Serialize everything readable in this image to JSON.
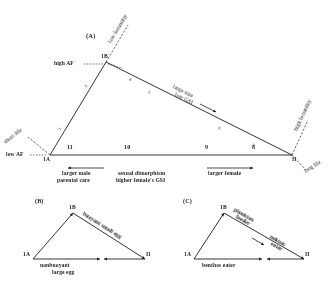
{
  "figure": {
    "caption_none": "",
    "panels": [
      {
        "id": "panel-a",
        "label": "(A)",
        "vertices": {
          "left": "1A",
          "top": "1B",
          "right": "II"
        },
        "axis_numbers_bottom": [
          "11",
          "10",
          "9",
          "8"
        ],
        "axis_numbers_left": [
          "2",
          "3"
        ],
        "axis_numbers_hypotenuse": [
          "4",
          "5",
          "6",
          "7"
        ],
        "annotations": {
          "top_diagonal": "low fecundity",
          "left_diagonal": "short life",
          "right_diagonal": "high fecundity",
          "right_diagonal_lower": "long life",
          "left_vertex_upper": "high AF",
          "left_vertex_lower": "low AF",
          "hypotenuse_line1": "large size",
          "hypotenuse_line2": "low GSI",
          "bottom_left_arrow_line1": "larger male",
          "bottom_left_arrow_line2": "parental care",
          "bottom_center_line1": "sexual dimorphism",
          "bottom_center_line2": "higher female's GSI",
          "bottom_right_arrow": "larger female"
        }
      },
      {
        "id": "panel-b",
        "label": "(B)",
        "vertices": {
          "left": "1A",
          "top": "1B",
          "right": "II"
        },
        "annotations": {
          "hypotenuse": "buoyant small egg",
          "bottom_line1": "nonbuoyant",
          "bottom_line2": "large egg"
        }
      },
      {
        "id": "panel-c",
        "label": "(C)",
        "vertices": {
          "left": "1A",
          "top": "1B",
          "right": "II"
        },
        "annotations": {
          "upper_left_line1": "plankton",
          "upper_left_line2": "feeder",
          "hypotenuse_line1": "nekton",
          "hypotenuse_line2": "eater",
          "bottom": "benthos eater"
        }
      }
    ],
    "colors": {
      "ink": "#1d1d1d",
      "background": "#ffffff"
    }
  }
}
